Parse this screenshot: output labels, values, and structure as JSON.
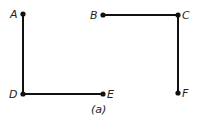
{
  "figure": {
    "caption": "(a)",
    "points": [
      {
        "id": "A",
        "label": "A",
        "x": 23,
        "y": 14
      },
      {
        "id": "B",
        "label": "B",
        "x": 103,
        "y": 15
      },
      {
        "id": "C",
        "label": "C",
        "x": 178,
        "y": 15
      },
      {
        "id": "D",
        "label": "D",
        "x": 23,
        "y": 94
      },
      {
        "id": "E",
        "label": "E",
        "x": 103,
        "y": 94
      },
      {
        "id": "F",
        "label": "F",
        "x": 178,
        "y": 93
      }
    ],
    "segments": [
      [
        "A",
        "D"
      ],
      [
        "D",
        "E"
      ],
      [
        "B",
        "C"
      ],
      [
        "C",
        "F"
      ]
    ],
    "colors": {
      "line": "#111111",
      "point": "#111111"
    }
  }
}
